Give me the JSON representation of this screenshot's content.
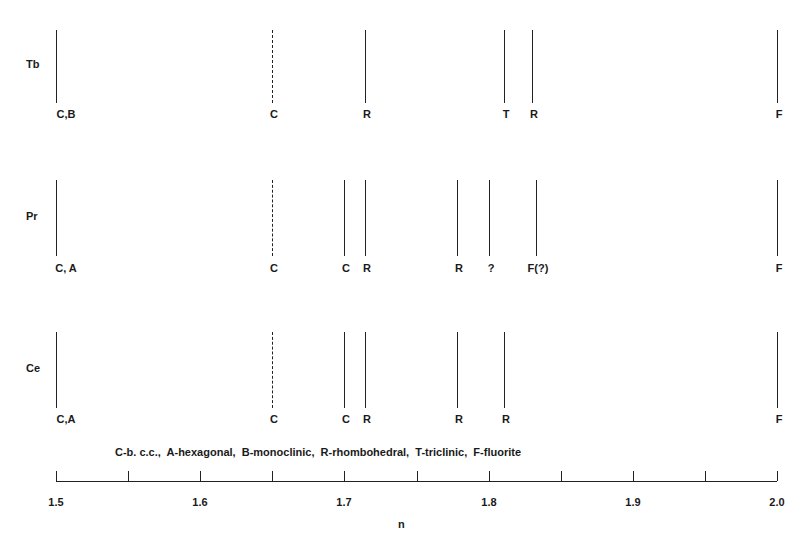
{
  "chart_data": {
    "type": "line-diagram",
    "title": "",
    "xlabel": "n",
    "ylabel": "",
    "xlim": [
      1.5,
      2.0
    ],
    "x_ticks": [
      1.5,
      1.55,
      1.6,
      1.65,
      1.7,
      1.75,
      1.8,
      1.85,
      1.9,
      1.95,
      2.0
    ],
    "x_tick_labels": [
      {
        "value": 1.5,
        "label": "1.5"
      },
      {
        "value": 1.6,
        "label": "1.6"
      },
      {
        "value": 1.7,
        "label": "1.7"
      },
      {
        "value": 1.8,
        "label": "1.8"
      },
      {
        "value": 1.9,
        "label": "1.9"
      },
      {
        "value": 2.0,
        "label": "2.0"
      }
    ],
    "legend": "C-b. c.c.,  A-hexagonal,  B-monoclinic,  R-rhombohedral,  T-triclinic,  F-fluorite",
    "legend_entries": [
      {
        "code": "C",
        "meaning": "b. c.c."
      },
      {
        "code": "A",
        "meaning": "hexagonal"
      },
      {
        "code": "B",
        "meaning": "monoclinic"
      },
      {
        "code": "R",
        "meaning": "rhombohedral"
      },
      {
        "code": "T",
        "meaning": "triclinic"
      },
      {
        "code": "F",
        "meaning": "fluorite"
      }
    ],
    "series": [
      {
        "name": "Tb",
        "lines": [
          {
            "n": 1.5,
            "label": "C,B",
            "style": "solid"
          },
          {
            "n": 1.65,
            "label": "C",
            "style": "dashed"
          },
          {
            "n": 1.714,
            "label": "R",
            "style": "solid"
          },
          {
            "n": 1.811,
            "label": "T",
            "style": "solid"
          },
          {
            "n": 1.83,
            "label": "R",
            "style": "solid"
          },
          {
            "n": 2.0,
            "label": "F",
            "style": "solid"
          }
        ]
      },
      {
        "name": "Pr",
        "lines": [
          {
            "n": 1.5,
            "label": "C, A",
            "style": "solid"
          },
          {
            "n": 1.65,
            "label": "C",
            "style": "dashed"
          },
          {
            "n": 1.7,
            "label": "C",
            "style": "solid"
          },
          {
            "n": 1.714,
            "label": "R",
            "style": "solid"
          },
          {
            "n": 1.778,
            "label": "R",
            "style": "solid"
          },
          {
            "n": 1.8,
            "label": "?",
            "style": "solid"
          },
          {
            "n": 1.833,
            "label": "F(?)",
            "style": "solid"
          },
          {
            "n": 2.0,
            "label": "F",
            "style": "solid"
          }
        ]
      },
      {
        "name": "Ce",
        "lines": [
          {
            "n": 1.5,
            "label": "C,A",
            "style": "solid"
          },
          {
            "n": 1.65,
            "label": "C",
            "style": "dashed"
          },
          {
            "n": 1.7,
            "label": "C",
            "style": "solid"
          },
          {
            "n": 1.714,
            "label": "R",
            "style": "solid"
          },
          {
            "n": 1.778,
            "label": "R",
            "style": "solid"
          },
          {
            "n": 1.811,
            "label": "R",
            "style": "solid"
          },
          {
            "n": 2.0,
            "label": "F",
            "style": "solid"
          }
        ]
      }
    ]
  },
  "layout": {
    "rows": [
      {
        "name": "Tb",
        "label_x": 26,
        "label_y": 65,
        "line_top": 30,
        "line_bottom": 103,
        "text_y": 108
      },
      {
        "name": "Pr",
        "label_x": 26,
        "label_y": 217,
        "line_top": 180,
        "line_bottom": 256,
        "text_y": 262
      },
      {
        "name": "Ce",
        "label_x": 26,
        "label_y": 369,
        "line_top": 332,
        "line_bottom": 408,
        "text_y": 413
      }
    ],
    "axis_x0": 56,
    "axis_x1": 777,
    "axis_y": 481,
    "tick_label_y": 496,
    "legend_y": 452,
    "xlabel_y": 518
  }
}
